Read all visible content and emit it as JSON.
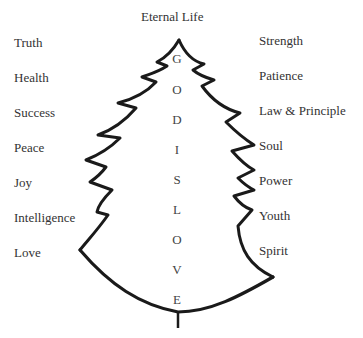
{
  "title": "Eternal Life",
  "left_labels": [
    "Truth",
    "Health",
    "Success",
    "Peace",
    "Joy",
    "Intelligence",
    "Love"
  ],
  "right_labels": [
    "Strength",
    "Patience",
    "Law & Principle",
    "Soul",
    "Power",
    "Youth",
    "Spirit"
  ],
  "trunk_letters": [
    "G",
    "O",
    "D",
    "I",
    "S",
    "L",
    "O",
    "V",
    "E"
  ],
  "trunk_phrase": "GOD IS LOVE",
  "colors": {
    "ink": "#1a1a1a",
    "text": "#333333",
    "background": "#ffffff"
  }
}
